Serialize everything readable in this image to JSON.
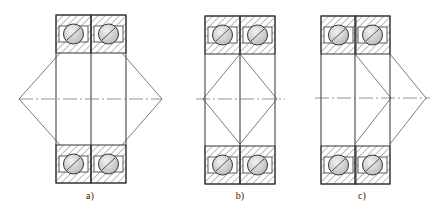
{
  "figure": {
    "panels": [
      {
        "id": "a",
        "label": "a)",
        "x": 56,
        "w": 70,
        "top": 15,
        "bottom": 183,
        "divider": 91,
        "apexL": 19,
        "apexR": 162,
        "type": "back-to-back"
      },
      {
        "id": "b",
        "label": "b)",
        "x": 205,
        "w": 70,
        "top": 16,
        "bottom": 184,
        "divider": 240,
        "type": "face-to-face"
      },
      {
        "id": "c",
        "label": "c)",
        "x": 321,
        "w": 69,
        "top": 16,
        "bottom": 184,
        "divider": 355,
        "apexR": 426,
        "type": "tandem"
      }
    ],
    "colors": {
      "line": "#333333",
      "ball": "#cfcfcf",
      "hatch": "#555555"
    }
  }
}
